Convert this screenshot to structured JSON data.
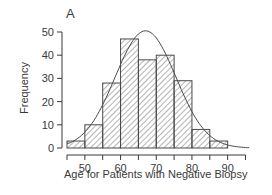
{
  "chart_data": {
    "type": "bar",
    "subtype": "histogram_with_normal_curve",
    "title": "A",
    "xlabel": "Age for Patients with Negative Biopsy",
    "ylabel": "Frequency",
    "bin_edges": [
      45,
      50,
      55,
      60,
      65,
      70,
      75,
      80,
      85,
      90
    ],
    "categories": [
      "45-50",
      "50-55",
      "55-60",
      "60-65",
      "65-70",
      "70-75",
      "75-80",
      "80-85",
      "85-90"
    ],
    "values": [
      3,
      10,
      28,
      47,
      38,
      40,
      29,
      8,
      3
    ],
    "fitted_curve": {
      "type": "normal",
      "mean": 67,
      "peak": 50.5,
      "sd": 8.5
    },
    "x_ticks": [
      45,
      50,
      55,
      60,
      65,
      70,
      75,
      80,
      85,
      90,
      95
    ],
    "x_tick_labels": [
      "50",
      "60",
      "70",
      "80",
      "90"
    ],
    "y_ticks": [
      0,
      10,
      20,
      30,
      40,
      50
    ],
    "y_tick_labels": [
      "0",
      "10",
      "20",
      "30",
      "40",
      "50"
    ],
    "xlim": [
      45,
      95
    ],
    "ylim": [
      0,
      50
    ],
    "grid": false,
    "legend": null,
    "bar_fill": "diagonal-hatch",
    "colors": {
      "stroke": "#4a4a4a",
      "hatch": "#6a6a6a",
      "background": "#ffffff"
    }
  }
}
